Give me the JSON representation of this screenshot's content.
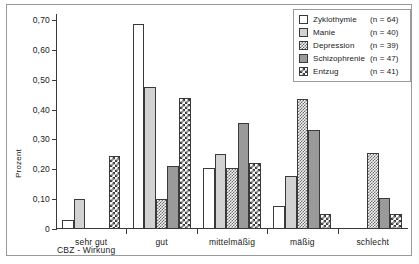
{
  "chart_data": {
    "type": "bar",
    "title": "",
    "xlabel": "CBZ - Wirkung",
    "ylabel": "Prozent",
    "categories": [
      "sehr gut",
      "gut",
      "mittelmäßig",
      "mäßig",
      "schlecht"
    ],
    "ylim": [
      0,
      0.72
    ],
    "ytick_values": [
      0,
      0.1,
      0.2,
      0.3,
      0.4,
      0.5,
      0.6,
      0.7
    ],
    "ytick_labels": [
      "0",
      "0,10",
      "0,20",
      "0,30",
      "0,40",
      "0,50",
      "0,60",
      "0,70"
    ],
    "grid": false,
    "legend_position": "top-right",
    "series": [
      {
        "name": "Zyklothymie",
        "n_label": "(n = 64)",
        "n": 64,
        "pattern": "solid-white",
        "color": "#ffffff",
        "values": [
          0.031,
          0.688,
          0.203,
          0.078,
          0.0
        ]
      },
      {
        "name": "Manie",
        "n_label": "(n = 40)",
        "n": 40,
        "pattern": "solid-light-gray",
        "color": "#d2d2d2",
        "values": [
          0.1,
          0.475,
          0.25,
          0.178,
          0.0
        ]
      },
      {
        "name": "Depression",
        "n_label": "(n = 39)",
        "n": 39,
        "pattern": "checkerboard",
        "color": "#f2f2f2",
        "values": [
          0.0,
          0.1,
          0.203,
          0.436,
          0.256
        ]
      },
      {
        "name": "Schizophrenie",
        "n_label": "(n = 47)",
        "n": 47,
        "pattern": "solid-mid-gray",
        "color": "#9a9a9a",
        "values": [
          0.0,
          0.21,
          0.354,
          0.333,
          0.105
        ]
      },
      {
        "name": "Entzug",
        "n_label": "(n = 41)",
        "n": 41,
        "pattern": "coarse-dot",
        "color": "#ffffff",
        "values": [
          0.244,
          0.439,
          0.22,
          0.051,
          0.051
        ]
      }
    ]
  }
}
